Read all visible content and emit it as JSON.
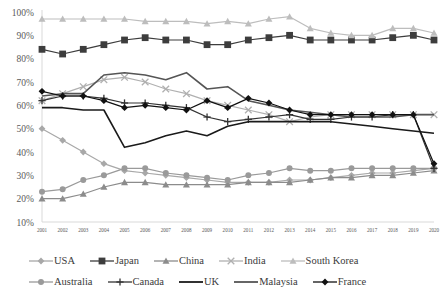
{
  "chart_data": {
    "type": "line",
    "title": "",
    "xlabel": "",
    "ylabel": "",
    "ylim": [
      10,
      100
    ],
    "ytick_labels": [
      "10%",
      "20%",
      "30%",
      "40%",
      "50%",
      "60%",
      "70%",
      "80%",
      "90%",
      "100%"
    ],
    "ytick_values": [
      10,
      20,
      30,
      40,
      50,
      60,
      70,
      80,
      90,
      100
    ],
    "grid": false,
    "legend_position": "bottom",
    "legend_rows": 2,
    "categories": [
      "2001",
      "2002",
      "2003",
      "2004",
      "2005",
      "2006",
      "2007",
      "2008",
      "2009",
      "2010",
      "2011",
      "2012",
      "2013",
      "2014",
      "2015",
      "2016",
      "2017",
      "2018",
      "2019",
      "2020"
    ],
    "x": [
      2001,
      2002,
      2003,
      2004,
      2005,
      2006,
      2007,
      2008,
      2009,
      2010,
      2011,
      2012,
      2013,
      2014,
      2015,
      2016,
      2017,
      2018,
      2019,
      2020
    ],
    "series": [
      {
        "name": "USA",
        "color": "#a8a8a8",
        "marker": "diamond",
        "values": [
          50,
          45,
          40,
          35,
          32,
          31,
          30,
          29,
          28,
          27,
          27,
          27,
          28,
          28,
          29,
          30,
          31,
          31,
          32,
          33
        ]
      },
      {
        "name": "Japan",
        "color": "#3d3d3d",
        "marker": "square",
        "values": [
          84,
          82,
          84,
          86,
          88,
          89,
          88,
          88,
          86,
          86,
          88,
          89,
          90,
          88,
          88,
          88,
          88,
          89,
          90,
          88
        ]
      },
      {
        "name": "China",
        "color": "#8c8c8c",
        "marker": "triangle",
        "values": [
          20,
          20,
          22,
          25,
          27,
          27,
          26,
          26,
          26,
          26,
          27,
          27,
          27,
          28,
          29,
          29,
          30,
          30,
          31,
          32
        ]
      },
      {
        "name": "India",
        "color": "#b0b0b0",
        "marker": "cross",
        "values": [
          62,
          65,
          68,
          71,
          72,
          70,
          67,
          65,
          62,
          60,
          58,
          56,
          53,
          55,
          56,
          56,
          56,
          56,
          56,
          56
        ]
      },
      {
        "name": "South Korea",
        "color": "#bdbdbd",
        "marker": "triangle",
        "values": [
          97,
          97,
          97,
          97,
          97,
          96,
          96,
          96,
          95,
          96,
          95,
          97,
          98,
          93,
          91,
          90,
          90,
          93,
          93,
          91
        ]
      },
      {
        "name": "Australia",
        "color": "#9a9a9a",
        "marker": "circle",
        "values": [
          23,
          24,
          28,
          30,
          33,
          33,
          31,
          30,
          29,
          28,
          30,
          31,
          33,
          32,
          32,
          33,
          33,
          33,
          33,
          33
        ]
      },
      {
        "name": "Canada",
        "color": "#333333",
        "marker": "plus",
        "values": [
          62,
          64,
          64,
          63,
          61,
          61,
          60,
          59,
          55,
          53,
          54,
          55,
          56,
          54,
          54,
          55,
          55,
          56,
          56,
          33
        ]
      },
      {
        "name": "UK",
        "color": "#1a1a1a",
        "marker": "none",
        "values": [
          59,
          59,
          58,
          58,
          42,
          44,
          47,
          49,
          47,
          51,
          53,
          53,
          53,
          53,
          53,
          52,
          51,
          50,
          49,
          48
        ]
      },
      {
        "name": "Malaysia",
        "color": "#555555",
        "marker": "none",
        "values": [
          64,
          65,
          65,
          73,
          74,
          73,
          71,
          74,
          67,
          68,
          62,
          60,
          58,
          57,
          56,
          55,
          55,
          55,
          56,
          56
        ]
      },
      {
        "name": "France",
        "color": "#111111",
        "marker": "diamond",
        "values": [
          66,
          64,
          64,
          62,
          59,
          60,
          59,
          58,
          62,
          59,
          63,
          61,
          58,
          56,
          56,
          56,
          56,
          56,
          56,
          35
        ]
      }
    ]
  },
  "legend": {
    "rows": [
      [
        {
          "label": "USA",
          "series_index": 0
        },
        {
          "label": "Japan",
          "series_index": 1
        },
        {
          "label": "China",
          "series_index": 2
        },
        {
          "label": "India",
          "series_index": 3
        },
        {
          "label": "South Korea",
          "series_index": 4
        }
      ],
      [
        {
          "label": "Australia",
          "series_index": 5
        },
        {
          "label": "Canada",
          "series_index": 6
        },
        {
          "label": "UK",
          "series_index": 7
        },
        {
          "label": "Malaysia",
          "series_index": 8
        },
        {
          "label": "France",
          "series_index": 9
        }
      ]
    ]
  }
}
